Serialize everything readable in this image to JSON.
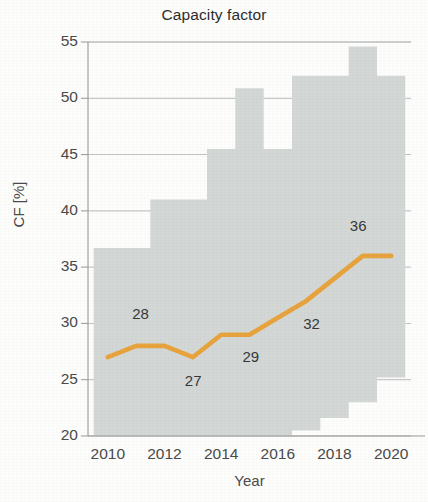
{
  "chart_data": {
    "type": "line",
    "title": "Capacity factor",
    "xlabel": "Year",
    "ylabel": "CF [%]",
    "grid": true,
    "legend": "none",
    "xlim": [
      2009.3,
      2020.7
    ],
    "ylim": [
      20,
      55
    ],
    "ytick_labels": [
      "55",
      "50",
      "45",
      "40",
      "35",
      "30",
      "25",
      "20"
    ],
    "ytick_values": [
      55,
      50,
      45,
      40,
      35,
      30,
      25,
      20
    ],
    "xtick_labels": [
      "2010",
      "2012",
      "2014",
      "2016",
      "2018",
      "2020"
    ],
    "xtick_values": [
      2010,
      2012,
      2014,
      2016,
      2018,
      2020
    ],
    "x": [
      2010,
      2011,
      2012,
      2013,
      2014,
      2015,
      2016,
      2017,
      2018,
      2019,
      2020
    ],
    "series": [
      {
        "name": "Capacity factor",
        "color": "#e8a33d",
        "values": [
          27,
          28,
          28,
          27,
          29,
          29,
          30.5,
          32,
          34,
          36,
          36
        ]
      }
    ],
    "band": {
      "name": "range",
      "color": "#d3d8d6",
      "upper": [
        36.7,
        36.7,
        41.0,
        41.0,
        45.5,
        50.9,
        45.5,
        52.0,
        52.0,
        54.6,
        52.0
      ],
      "lower": [
        20.0,
        20.0,
        20.0,
        20.0,
        20.0,
        20.0,
        20.0,
        20.5,
        21.6,
        23.0,
        25.2
      ]
    },
    "annotations": [
      {
        "label": "28",
        "x": 2011,
        "y": 28,
        "dx": 5,
        "dy": 32
      },
      {
        "label": "27",
        "x": 2013,
        "y": 27,
        "dx": 1,
        "dy": -24
      },
      {
        "label": "29",
        "x": 2015,
        "y": 29,
        "dx": 2,
        "dy": -22
      },
      {
        "label": "32",
        "x": 2017,
        "y": 32,
        "dx": 6,
        "dy": -23
      },
      {
        "label": "36",
        "x": 2019,
        "y": 36,
        "dx": -4,
        "dy": 30
      }
    ]
  }
}
